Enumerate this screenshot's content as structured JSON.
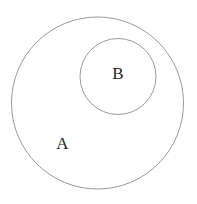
{
  "diagram": {
    "type": "subset-venn-diagram",
    "title": "",
    "background_color": "#ffffff",
    "stroke_color": "#9a9a9a",
    "label_color": "#262626",
    "canvas": {
      "width": 197,
      "height": 204
    },
    "sets": [
      {
        "id": "outer",
        "label": "A",
        "role": "superset",
        "center_x": 97.5,
        "center_y": 103,
        "radius": 86,
        "label_x": 62.5,
        "label_y": 145,
        "fill": "#ffffff",
        "stroke": "#9a9a9a",
        "stroke_width": 1
      },
      {
        "id": "inner",
        "label": "B",
        "role": "subset",
        "center_x": 118,
        "center_y": 76.5,
        "radius": 38,
        "label_x": 118,
        "label_y": 75,
        "fill": "#ffffff",
        "stroke": "#9a9a9a",
        "stroke_width": 1
      }
    ]
  }
}
